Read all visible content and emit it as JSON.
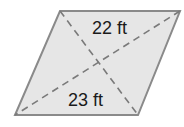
{
  "figure": {
    "shape": "parallelogram",
    "fill_color": "#e6e6e6",
    "stroke_color": "#8a8a8a",
    "diagonal_color": "#7a7a7a",
    "vertices": {
      "top_left": [
        60,
        11
      ],
      "top_right": [
        180,
        11
      ],
      "bottom_right": [
        138,
        115
      ],
      "bottom_left": [
        15,
        115
      ]
    },
    "labels": {
      "diagonal_1": "22 ft",
      "diagonal_2": "23 ft"
    }
  }
}
